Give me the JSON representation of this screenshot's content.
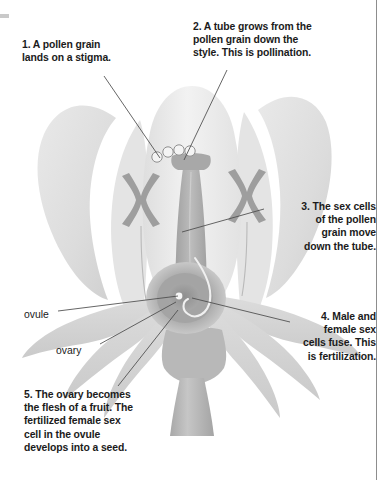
{
  "diagram": {
    "background_color": "#ffffff",
    "line_color": "#4a4a4a",
    "text_color": "#1b1b1b"
  },
  "annotations": [
    {
      "id": "step-1",
      "number": "1",
      "text": "1. A pollen grain\nlands on a stigma.",
      "align": "left"
    },
    {
      "id": "step-2",
      "number": "2",
      "text": "2. A tube grows from the\npollen grain down the\nstyle. This is pollination.",
      "align": "left"
    },
    {
      "id": "step-3",
      "number": "3",
      "text": "3. The sex cells\nof the pollen\ngrain move\ndown the tube.",
      "align": "right"
    },
    {
      "id": "step-4",
      "number": "4",
      "text": "4. Male and\nfemale sex\ncells fuse. This\nis fertilization.",
      "align": "right"
    },
    {
      "id": "step-5",
      "number": "5",
      "text": "5. The ovary becomes\nthe flesh of a fruit. The\nfertilized female sex\ncell in the ovule\ndevelops into a seed.",
      "align": "left"
    }
  ],
  "part_labels": [
    {
      "id": "ovule",
      "text": "ovule"
    },
    {
      "id": "ovary",
      "text": "ovary"
    }
  ],
  "flower_parts": {
    "petal_fill": "#e8e8e8",
    "sepal_fill": "#d8d8d8",
    "stem_fill": "#b4b4b4",
    "style_fill": "#b0b0b0",
    "anther_fill": "#9e9e9e",
    "ovary_fill": "#9a9a9a",
    "pollen_grain_stroke": "#8a8a8a",
    "pollen_grain_count": "4"
  }
}
